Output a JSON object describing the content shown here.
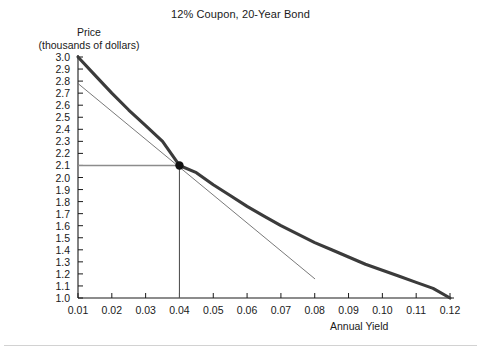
{
  "chart_data": {
    "type": "line",
    "title": "12% Coupon, 20-Year Bond",
    "xlabel": "Annual Yield",
    "ylabel_line1": "Price",
    "ylabel_line2": "(thousands of dollars)",
    "xlim": [
      0.01,
      0.12
    ],
    "ylim": [
      1.0,
      3.0
    ],
    "grid": false,
    "legend": "none",
    "xticks": [
      "0.01",
      "0.02",
      "0.03",
      "0.04",
      "0.05",
      "0.06",
      "0.07",
      "0.08",
      "0.09",
      "0.10",
      "0.11",
      "0.12"
    ],
    "xtick_values": [
      0.01,
      0.02,
      0.03,
      0.04,
      0.05,
      0.06,
      0.07,
      0.08,
      0.09,
      0.1,
      0.11,
      0.12
    ],
    "yticks": [
      "3.0",
      "2.9",
      "2.8",
      "2.7",
      "2.6",
      "2.5",
      "2.4",
      "2.3",
      "2.2",
      "2.1",
      "2.0",
      "1.9",
      "1.8",
      "1.7",
      "1.6",
      "1.5",
      "1.4",
      "1.3",
      "1.2",
      "1.1",
      "1.0"
    ],
    "ytick_values": [
      3.0,
      2.9,
      2.8,
      2.7,
      2.6,
      2.5,
      2.4,
      2.3,
      2.2,
      2.1,
      2.0,
      1.9,
      1.8,
      1.7,
      1.6,
      1.5,
      1.4,
      1.3,
      1.2,
      1.1,
      1.0
    ],
    "series": [
      {
        "name": "price-yield curve",
        "style": "thick-solid",
        "color": "#3b3b3b",
        "x": [
          0.01,
          0.015,
          0.02,
          0.025,
          0.03,
          0.035,
          0.04,
          0.045,
          0.05,
          0.055,
          0.06,
          0.065,
          0.07,
          0.075,
          0.08,
          0.085,
          0.09,
          0.095,
          0.1,
          0.105,
          0.11,
          0.115,
          0.12
        ],
        "values": [
          3.0,
          2.85,
          2.7,
          2.56,
          2.43,
          2.3,
          2.1,
          2.04,
          1.94,
          1.85,
          1.76,
          1.68,
          1.6,
          1.53,
          1.46,
          1.4,
          1.34,
          1.28,
          1.23,
          1.18,
          1.13,
          1.08,
          1.0
        ]
      },
      {
        "name": "tangent line at 0.04",
        "style": "thin-solid",
        "color": "#6a6a6a",
        "x": [
          0.01,
          0.08
        ],
        "values": [
          2.78,
          1.16
        ]
      }
    ],
    "annotations": [
      {
        "name": "tangency-point",
        "kind": "point",
        "x": 0.04,
        "y": 2.1,
        "marker": "filled-circle",
        "color": "#111111"
      },
      {
        "name": "price-reference-line",
        "kind": "hline",
        "y": 2.1,
        "from_x": 0.01,
        "to_x": 0.04,
        "color": "#8c8c8c"
      },
      {
        "name": "yield-reference-line",
        "kind": "vline",
        "x": 0.04,
        "from_y": 1.0,
        "to_y": 2.1,
        "color": "#555555"
      }
    ]
  }
}
